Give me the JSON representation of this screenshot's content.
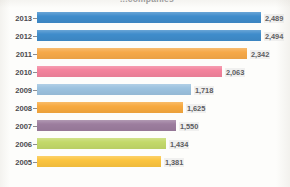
{
  "chart": {
    "title_fragment": "...companies",
    "axis": {
      "ylabel": "",
      "xlabel": ""
    }
  },
  "chart_data": {
    "type": "bar",
    "orientation": "horizontal",
    "title": "...companies",
    "xlabel": "",
    "ylabel": "",
    "grid": false,
    "legend": false,
    "xlim": [
      0,
      2700
    ],
    "categories": [
      "2013",
      "2012",
      "2011",
      "2010",
      "2009",
      "2008",
      "2007",
      "2006",
      "2005"
    ],
    "values": [
      2489,
      2494,
      2342,
      2063,
      1718,
      1625,
      1550,
      1434,
      1381
    ],
    "value_labels": [
      "2,489",
      "2,494",
      "2,342",
      "2,063",
      "1,718",
      "1,625",
      "1,550",
      "1,434",
      "1,381"
    ],
    "colors": [
      "#3f8ccb",
      "#3f8ccb",
      "#f6a949",
      "#f3829c",
      "#9cc2df",
      "#f7a93f",
      "#9c7d9e",
      "#c3d96a",
      "#fbc43f"
    ],
    "bars": [
      {
        "category": "2013",
        "value": 2489,
        "label": "2,489",
        "color": "#3f8ccb"
      },
      {
        "category": "2012",
        "value": 2494,
        "label": "2,494",
        "color": "#3f8ccb"
      },
      {
        "category": "2011",
        "value": 2342,
        "label": "2,342",
        "color": "#f6a949"
      },
      {
        "category": "2010",
        "value": 2063,
        "label": "2,063",
        "color": "#f3829c"
      },
      {
        "category": "2009",
        "value": 1718,
        "label": "1,718",
        "color": "#9cc2df"
      },
      {
        "category": "2008",
        "value": 1625,
        "label": "1,625",
        "color": "#f7a93f"
      },
      {
        "category": "2007",
        "value": 1550,
        "label": "1,550",
        "color": "#9c7d9e"
      },
      {
        "category": "2006",
        "value": 1434,
        "label": "1,434",
        "color": "#c3d96a"
      },
      {
        "category": "2005",
        "value": 1381,
        "label": "1,381",
        "color": "#fbc43f"
      }
    ]
  }
}
